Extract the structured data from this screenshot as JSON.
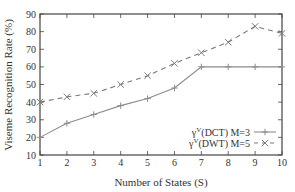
{
  "chart_data": {
    "type": "line",
    "title": "",
    "xlabel": "Number of States (S)",
    "ylabel": "Viseme Recognition Rate (%)",
    "xlim": [
      1,
      10
    ],
    "ylim": [
      10,
      90
    ],
    "x": [
      1,
      2,
      3,
      4,
      5,
      6,
      7,
      8,
      9,
      10
    ],
    "xticks": [
      1,
      2,
      3,
      4,
      5,
      6,
      7,
      8,
      9,
      10
    ],
    "yticks": [
      10,
      20,
      30,
      40,
      50,
      60,
      70,
      80,
      90
    ],
    "grid": false,
    "legend_position": "lower right",
    "series": [
      {
        "name": "γ^V(DCT) M=3",
        "legend_main": "γ",
        "legend_sup": "V",
        "legend_rest": "(DCT) M=3",
        "style": "solid",
        "marker": "+",
        "color": "#8c8c8c",
        "values": [
          20,
          28,
          33,
          38,
          42,
          48,
          60,
          60,
          60,
          60
        ]
      },
      {
        "name": "γ^V(DWT) M=5",
        "legend_main": "γ",
        "legend_sup": "V",
        "legend_rest": "(DWT) M=5",
        "style": "dashed",
        "marker": "x",
        "color": "#7a7a7a",
        "values": [
          40,
          43,
          45,
          50,
          55,
          62,
          68,
          74,
          83,
          79
        ]
      }
    ]
  },
  "colors": {
    "axis": "#444444",
    "text": "#333333"
  }
}
